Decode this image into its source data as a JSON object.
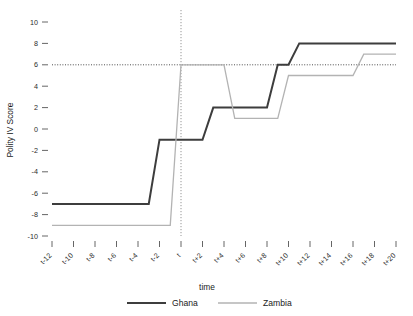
{
  "chart_data": {
    "type": "line",
    "title": "",
    "xlabel": "time",
    "ylabel": "Polity IV Score",
    "categories": [
      "t-12",
      "t-11",
      "t-10",
      "t-9",
      "t-8",
      "t-7",
      "t-6",
      "t-5",
      "t-4",
      "t-3",
      "t-2",
      "t-1",
      "t",
      "t+1",
      "t+2",
      "t+3",
      "t+4",
      "t+5",
      "t+6",
      "t+7",
      "t+8",
      "t+9",
      "t+10",
      "t+11",
      "t+12",
      "t+13",
      "t+14",
      "t+15",
      "t+16",
      "t+17",
      "t+18",
      "t+19",
      "t+20"
    ],
    "xticklabels": [
      "t-12",
      "t-10",
      "t-8",
      "t-6",
      "t-4",
      "t-2",
      "t",
      "t+2",
      "t+4",
      "t+6",
      "t+8",
      "t+10",
      "t+12",
      "t+14",
      "t+16",
      "t+18",
      "t+20"
    ],
    "yticklabels": [
      "10",
      "8",
      "6",
      "4",
      "2",
      "0",
      "-2",
      "-4",
      "-6",
      "-8",
      "-10"
    ],
    "ytickvalues": [
      10,
      8,
      6,
      4,
      2,
      0,
      -2,
      -4,
      -6,
      -8,
      -10
    ],
    "xlim": [
      -12,
      20
    ],
    "ylim": [
      -10,
      10
    ],
    "grid": false,
    "legend_position": "bottom",
    "reference_lines": [
      {
        "name": "polity-threshold-line",
        "orientation": "horizontal",
        "value": 6,
        "style": "dotted",
        "color": "#3a3a3a"
      },
      {
        "name": "event-time-line",
        "orientation": "vertical",
        "value": 0,
        "label": "t",
        "style": "dotted",
        "color": "#8a8a8a"
      }
    ],
    "series": [
      {
        "name": "Ghana",
        "color": "#3d3d3d",
        "width": 2.0,
        "x": [
          -12,
          -11,
          -10,
          -9,
          -8,
          -7,
          -6,
          -5,
          -4,
          -3,
          -2,
          -1,
          0,
          1,
          2,
          3,
          4,
          5,
          6,
          7,
          8,
          9,
          10,
          11,
          12,
          13,
          14,
          15,
          16,
          17,
          18,
          19,
          20
        ],
        "values": [
          -7,
          -7,
          -7,
          -7,
          -7,
          -7,
          -7,
          -7,
          -7,
          -7,
          -1,
          -1,
          -1,
          -1,
          -1,
          2,
          2,
          2,
          2,
          2,
          2,
          6,
          6,
          8,
          8,
          8,
          8,
          8,
          8,
          8,
          8,
          8,
          8
        ]
      },
      {
        "name": "Zambia",
        "color": "#b3b3b3",
        "width": 1.3,
        "x": [
          -12,
          -11,
          -10,
          -9,
          -8,
          -7,
          -6,
          -5,
          -4,
          -3,
          -2,
          -1,
          0,
          1,
          2,
          3,
          4,
          5,
          6,
          7,
          8,
          9,
          10,
          11,
          12,
          13,
          14,
          15,
          16,
          17,
          18,
          19,
          20
        ],
        "values": [
          -9,
          -9,
          -9,
          -9,
          -9,
          -9,
          -9,
          -9,
          -9,
          -9,
          -9,
          -9,
          6,
          6,
          6,
          6,
          6,
          1,
          1,
          1,
          1,
          1,
          5,
          5,
          5,
          5,
          5,
          5,
          5,
          7,
          7,
          7,
          7
        ]
      }
    ]
  },
  "legend": {
    "items": [
      {
        "label": "Ghana",
        "color": "#3d3d3d"
      },
      {
        "label": "Zambia",
        "color": "#b3b3b3"
      }
    ]
  },
  "axes": {
    "y_title": "Polity IV Score",
    "x_title": "time"
  }
}
